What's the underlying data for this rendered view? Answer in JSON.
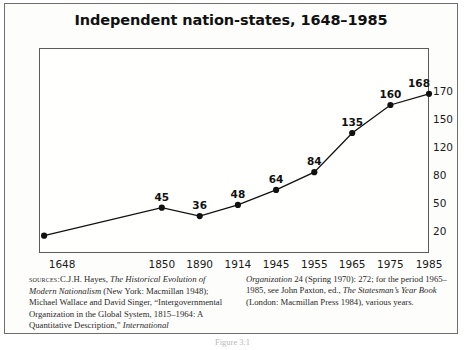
{
  "figure": {
    "title": "Independent nation-states, 1648–1985",
    "caption": "Figure 3.1"
  },
  "sources": {
    "label": "sources:",
    "left_col": [
      "C.J.H. Hayes, ",
      "The Historical Evolution of Modern Nationalism",
      " (New York: Macmillan 1948); Michael Wallace and David Singer, “Intergovernmental Organization in the Global System, 1815–1964: A Quantitative Description,” ",
      "International"
    ],
    "right_col": [
      "Organization",
      " 24 (Spring 1970): 272; for the period 1965–1985, see John Paxton, ed., ",
      "The Statesman’s Year Book",
      " (London: Macmillan Press 1984), various years."
    ]
  },
  "chart_data": {
    "type": "line",
    "title": "Independent nation-states, 1648–1985",
    "xlabel": "",
    "ylabel": "",
    "categories": [
      "1648",
      "1850",
      "1890",
      "1914",
      "1945",
      "1955",
      "1965",
      "1975",
      "1985"
    ],
    "values": [
      15,
      45,
      36,
      48,
      64,
      84,
      135,
      160,
      168
    ],
    "point_labels": [
      "",
      "45",
      "36",
      "48",
      "64",
      "84",
      "135",
      "160",
      "168"
    ],
    "y_tick_labels": [
      "170",
      "150",
      "120",
      "80",
      "50",
      "20"
    ],
    "y_tick_values": [
      170,
      150,
      120,
      80,
      50,
      20
    ],
    "y_axis_position": "right",
    "y_axis_scale": "non-linear (evenly spaced ticks)",
    "grid": false,
    "legend": false,
    "marker": "filled-circle",
    "line_color": "#111111",
    "marker_color": "#111111"
  }
}
